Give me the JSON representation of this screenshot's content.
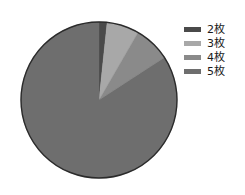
{
  "chart_data": {
    "type": "pie",
    "title": "",
    "subtitle": "",
    "xlabel": "",
    "ylabel": "",
    "grid": false,
    "legend_position": "right",
    "start_angle_deg": 0,
    "direction": "clockwise",
    "categories": [
      "2枚",
      "3枚",
      "4枚",
      "5枚"
    ],
    "values": [
      1.7,
      6.7,
      7.5,
      84.1
    ],
    "angles_deg": [
      6,
      24,
      27,
      303
    ],
    "colors": [
      "#4a4a4a",
      "#a8a8a8",
      "#8a8a8a",
      "#6e6e6e"
    ],
    "outline_color": "#2b2b2b",
    "center": {
      "x": 99,
      "y": 100
    },
    "radius": 78,
    "slices": [
      {
        "label": "2枚",
        "value": 1.7,
        "angle_deg": 6,
        "color": "#4a4a4a"
      },
      {
        "label": "3枚",
        "value": 6.7,
        "angle_deg": 24,
        "color": "#a8a8a8"
      },
      {
        "label": "4枚",
        "value": 7.5,
        "angle_deg": 27,
        "color": "#8a8a8a"
      },
      {
        "label": "5枚",
        "value": 84.1,
        "angle_deg": 303,
        "color": "#6e6e6e"
      }
    ]
  },
  "legend": {
    "items": [
      {
        "label": "2枚",
        "color": "#4a4a4a"
      },
      {
        "label": "3枚",
        "color": "#a8a8a8"
      },
      {
        "label": "4枚",
        "color": "#8a8a8a"
      },
      {
        "label": "5枚",
        "color": "#6e6e6e"
      }
    ]
  }
}
